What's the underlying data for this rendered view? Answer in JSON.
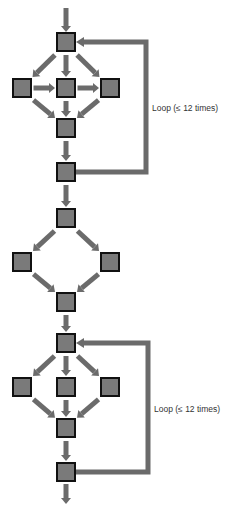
{
  "colors": {
    "node_fill": "#7a7a7a",
    "node_border": "#111111",
    "edge": "#6b6b6b",
    "text": "#333333",
    "background": "#ffffff"
  },
  "node_size": 18,
  "sections": [
    {
      "id": "loop-1",
      "nodes": [
        {
          "id": "a1",
          "x": 66,
          "y": 42
        },
        {
          "id": "a2",
          "x": 22,
          "y": 88
        },
        {
          "id": "a3",
          "x": 66,
          "y": 88
        },
        {
          "id": "a4",
          "x": 110,
          "y": 88
        },
        {
          "id": "a5",
          "x": 66,
          "y": 128
        },
        {
          "id": "a6",
          "x": 66,
          "y": 172
        }
      ],
      "edges": [
        [
          "a1",
          "a2"
        ],
        [
          "a1",
          "a3"
        ],
        [
          "a1",
          "a4"
        ],
        [
          "a2",
          "a3"
        ],
        [
          "a3",
          "a4"
        ],
        [
          "a2",
          "a5"
        ],
        [
          "a3",
          "a5"
        ],
        [
          "a4",
          "a5"
        ],
        [
          "a5",
          "a6"
        ]
      ],
      "loop": {
        "from": "a6",
        "to": "a1",
        "right_x": 146,
        "label": "Loop (≤ 12 times)",
        "label_x": 152,
        "label_y": 103
      }
    },
    {
      "id": "diamond",
      "nodes": [
        {
          "id": "b1",
          "x": 66,
          "y": 218
        },
        {
          "id": "b2",
          "x": 22,
          "y": 262
        },
        {
          "id": "b3",
          "x": 110,
          "y": 262
        },
        {
          "id": "b4",
          "x": 66,
          "y": 302
        }
      ],
      "edges": [
        [
          "a6",
          "b1"
        ],
        [
          "b1",
          "b2"
        ],
        [
          "b1",
          "b3"
        ],
        [
          "b2",
          "b4"
        ],
        [
          "b3",
          "b4"
        ]
      ]
    },
    {
      "id": "loop-2",
      "nodes": [
        {
          "id": "c1",
          "x": 66,
          "y": 343
        },
        {
          "id": "c2",
          "x": 22,
          "y": 387
        },
        {
          "id": "c3",
          "x": 66,
          "y": 387
        },
        {
          "id": "c4",
          "x": 110,
          "y": 387
        },
        {
          "id": "c5",
          "x": 66,
          "y": 428
        },
        {
          "id": "c6",
          "x": 66,
          "y": 472
        }
      ],
      "edges": [
        [
          "b4",
          "c1"
        ],
        [
          "c1",
          "c2"
        ],
        [
          "c1",
          "c3"
        ],
        [
          "c1",
          "c4"
        ],
        [
          "c2",
          "c5"
        ],
        [
          "c3",
          "c5"
        ],
        [
          "c4",
          "c5"
        ],
        [
          "c5",
          "c6"
        ]
      ],
      "loop": {
        "from": "c6",
        "to": "c1",
        "right_x": 148,
        "label": "Loop (≤ 12 times)",
        "label_x": 154,
        "label_y": 404
      }
    }
  ],
  "entry_arrow": {
    "x": 66,
    "y1": 8,
    "to": "a1"
  },
  "exit_arrow": {
    "from": "c6",
    "x": 66,
    "y2": 504
  },
  "labels": {
    "loop_1": "Loop (≤ 12 times)",
    "loop_2": "Loop (≤ 12 times)"
  }
}
